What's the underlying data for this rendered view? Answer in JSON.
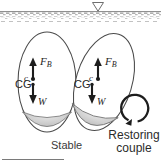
{
  "figure": {
    "title_caption": "Stable",
    "water": {
      "level_marker": "water-level-triangle",
      "surface_label": ""
    },
    "bodies": [
      {
        "id": "upright-body",
        "state": "upright",
        "buoyancy_label": "F",
        "buoyancy_sub": "B",
        "center_of_buoyancy_label": "c",
        "center_of_gravity_label": "CG",
        "weight_label": "W"
      },
      {
        "id": "tilted-body",
        "state": "tilted",
        "buoyancy_label": "F",
        "buoyancy_sub": "B",
        "center_of_buoyancy_label": "c",
        "center_of_gravity_label": "CG",
        "weight_label": "W"
      }
    ],
    "couple": {
      "line1": "Restoring",
      "line2": "couple",
      "direction": "counterclockwise"
    },
    "colors": {
      "ink": "#262626",
      "outline": "#3c3c3c",
      "ballast_fill": "#cfcfcf",
      "water_hatch": "#9a9a9a",
      "background": "#ffffff"
    }
  }
}
